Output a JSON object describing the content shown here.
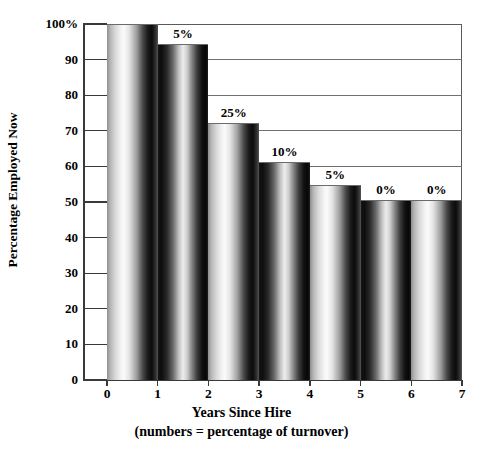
{
  "chart_data": {
    "type": "bar",
    "title": "",
    "xlabel": "Years Since Hire",
    "xlabel_sub": "(numbers = percentage of turnover)",
    "ylabel": "Percentage Employed Now",
    "categories": [
      "0",
      "1",
      "2",
      "3",
      "4",
      "5",
      "6"
    ],
    "x_tick_labels": [
      "0",
      "1",
      "2",
      "3",
      "4",
      "5",
      "6",
      "7"
    ],
    "values": [
      100,
      94.5,
      72.3,
      61.3,
      54.7,
      50.5,
      50.5
    ],
    "point_labels": [
      "",
      "5%",
      "25%",
      "10%",
      "5%",
      "0%",
      "0%"
    ],
    "y_tick_labels": [
      "100%",
      "90",
      "80",
      "70",
      "60",
      "50",
      "40",
      "30",
      "20",
      "10",
      "0"
    ],
    "y_tick_values": [
      100,
      90,
      80,
      70,
      60,
      50,
      40,
      30,
      20,
      10,
      0
    ],
    "ylim": [
      0,
      100
    ],
    "xlim": [
      0,
      7
    ],
    "grid": "horizontal",
    "legend": "none",
    "bar_style": "cylindrical-gradient-grayscale",
    "colors": {
      "axis": "#3a3a3a",
      "grid": "#6f6f6f",
      "text": "#000000",
      "background": "#ffffff",
      "bar_light": "#f2f2f2",
      "bar_dark": "#0b0b0b"
    }
  }
}
